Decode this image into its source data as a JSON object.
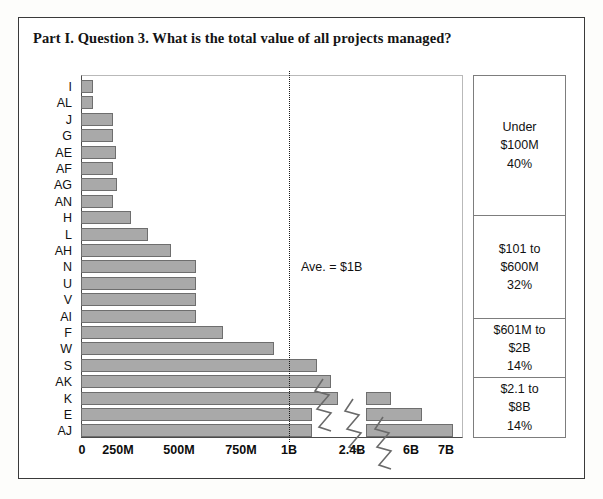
{
  "chart_data": {
    "type": "bar",
    "title": "Part I. Question 3. What is the total value of all projects managed?",
    "orientation": "horizontal",
    "xlabel": "",
    "ylabel": "",
    "grid": false,
    "axis_break": true,
    "xticks": [
      {
        "label": "0",
        "value": 0
      },
      {
        "label": "250M",
        "value": 250
      },
      {
        "label": "500M",
        "value": 500
      },
      {
        "label": "750M",
        "value": 750
      },
      {
        "label": "1B",
        "value": 1000
      },
      {
        "label": "2.4B",
        "value": 2400
      },
      {
        "label": "6B",
        "value": 6000
      },
      {
        "label": "7B",
        "value": 7000
      }
    ],
    "categories": [
      "I",
      "AL",
      "J",
      "G",
      "AE",
      "AF",
      "AG",
      "AN",
      "H",
      "L",
      "AH",
      "N",
      "U",
      "V",
      "AI",
      "F",
      "W",
      "S",
      "AK",
      "K",
      "E",
      "AJ"
    ],
    "values": [
      30,
      30,
      105,
      105,
      115,
      105,
      120,
      105,
      160,
      215,
      290,
      375,
      375,
      375,
      375,
      460,
      625,
      1065,
      1115,
      1160,
      2400,
      6000
    ],
    "value_unit": "USD millions",
    "annotation": {
      "text": "Ave. = $1B",
      "at_value": 1000
    },
    "legend_position": "right",
    "legend_entries": [
      {
        "range": "Under $100M",
        "pct": "40%",
        "share": 40
      },
      {
        "range": "$101 to $600M",
        "pct": "32%",
        "share": 32
      },
      {
        "range": "$601M to $2B",
        "pct": "14%",
        "share": 14
      },
      {
        "range": "$2.1 to $8B",
        "pct": "14%",
        "share": 14
      }
    ],
    "colors": {
      "bar_fill": "#a9a9a9",
      "bar_stroke": "#6e6e6e",
      "axis": "#4a4a4a",
      "frame": "#3a3a3a",
      "background": "#ffffff"
    }
  },
  "title": "Part I. Question 3. What is the total value of all projects managed?",
  "annotation_text": "Ave. = $1B",
  "bars": [
    {
      "label": "I",
      "end_px": 12
    },
    {
      "label": "AL",
      "end_px": 12
    },
    {
      "label": "J",
      "end_px": 32
    },
    {
      "label": "G",
      "end_px": 32
    },
    {
      "label": "AE",
      "end_px": 35
    },
    {
      "label": "AF",
      "end_px": 32
    },
    {
      "label": "AG",
      "end_px": 36
    },
    {
      "label": "AN",
      "end_px": 32
    },
    {
      "label": "H",
      "end_px": 50
    },
    {
      "label": "L",
      "end_px": 67
    },
    {
      "label": "AH",
      "end_px": 90
    },
    {
      "label": "N",
      "end_px": 115
    },
    {
      "label": "U",
      "end_px": 115
    },
    {
      "label": "V",
      "end_px": 115
    },
    {
      "label": "AI",
      "end_px": 115
    },
    {
      "label": "F",
      "end_px": 142
    },
    {
      "label": "W",
      "end_px": 193
    },
    {
      "label": "S",
      "end_px": 236
    },
    {
      "label": "AK",
      "end_px": 250
    },
    {
      "label": "K",
      "end_px": 257,
      "break_seg": {
        "start_px": 285,
        "end_px": 310
      }
    },
    {
      "label": "E",
      "end_px": 231,
      "break_seg": {
        "start_px": 285,
        "end_px": 341
      }
    },
    {
      "label": "AJ",
      "end_px": 231,
      "break_seg": {
        "start_px": 285,
        "end_px": 372
      }
    }
  ],
  "xticks": [
    "0",
    "250M",
    "500M",
    "750M",
    "1B",
    "2.4B",
    "6B",
    "7B"
  ],
  "legend": [
    {
      "l1": "Under",
      "l2": "$100M",
      "l3": "40%",
      "height": 140
    },
    {
      "l1": "$101 to",
      "l2": "$600M",
      "l3": "32%",
      "height": 103
    },
    {
      "l1": "$601M to",
      "l2": "$2B",
      "l3": "14%",
      "height": 59
    },
    {
      "l1": "$2.1 to",
      "l2": "$8B",
      "l3": "14%",
      "height": 59
    }
  ]
}
